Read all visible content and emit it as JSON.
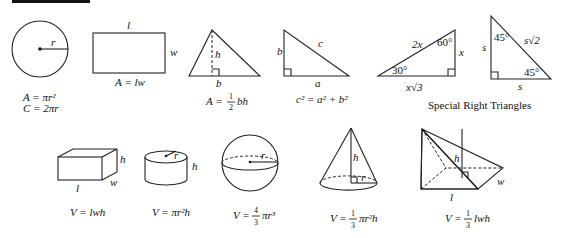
{
  "header_bar": "reference-header",
  "figures": {
    "circle": {
      "radius_label": "r",
      "formula_area": "A = πr²",
      "formula_circumference": "C = 2πr"
    },
    "rectangle": {
      "length_label": "l",
      "width_label": "w",
      "formula": "A = lw"
    },
    "triangle": {
      "height_label": "h",
      "base_label": "b",
      "formula_prefix": "A =",
      "frac_num": "1",
      "frac_den": "2",
      "formula_suffix": "bh"
    },
    "right_triangle": {
      "leg_b": "b",
      "leg_a": "a",
      "hyp_c": "c",
      "formula": "c² = a² + b²"
    },
    "triangle_30_60_90": {
      "hyp": "2x",
      "short_leg": "x",
      "long_leg": "x√3",
      "angle_top": "60°",
      "angle_left": "30°"
    },
    "triangle_45_45_90": {
      "leg_left": "s",
      "leg_bottom": "s",
      "hyp": "s√2",
      "angle_top": "45°",
      "angle_right": "45°"
    },
    "special_caption": "Special Right Triangles",
    "box": {
      "l": "l",
      "w": "w",
      "h": "h",
      "formula": "V = lwh"
    },
    "cylinder": {
      "r": "r",
      "h": "h",
      "formula": "V = πr²h"
    },
    "sphere": {
      "r": "r",
      "formula_prefix": "V =",
      "frac_num": "4",
      "frac_den": "3",
      "formula_suffix": "πr³"
    },
    "cone": {
      "h": "h",
      "r": "r",
      "formula_prefix": "V =",
      "frac_num": "1",
      "frac_den": "3",
      "formula_suffix": "πr²h"
    },
    "pyramid": {
      "h": "h",
      "l": "l",
      "w": "w",
      "formula_prefix": "V =",
      "frac_num": "1",
      "frac_den": "3",
      "formula_suffix": "lwh"
    }
  }
}
